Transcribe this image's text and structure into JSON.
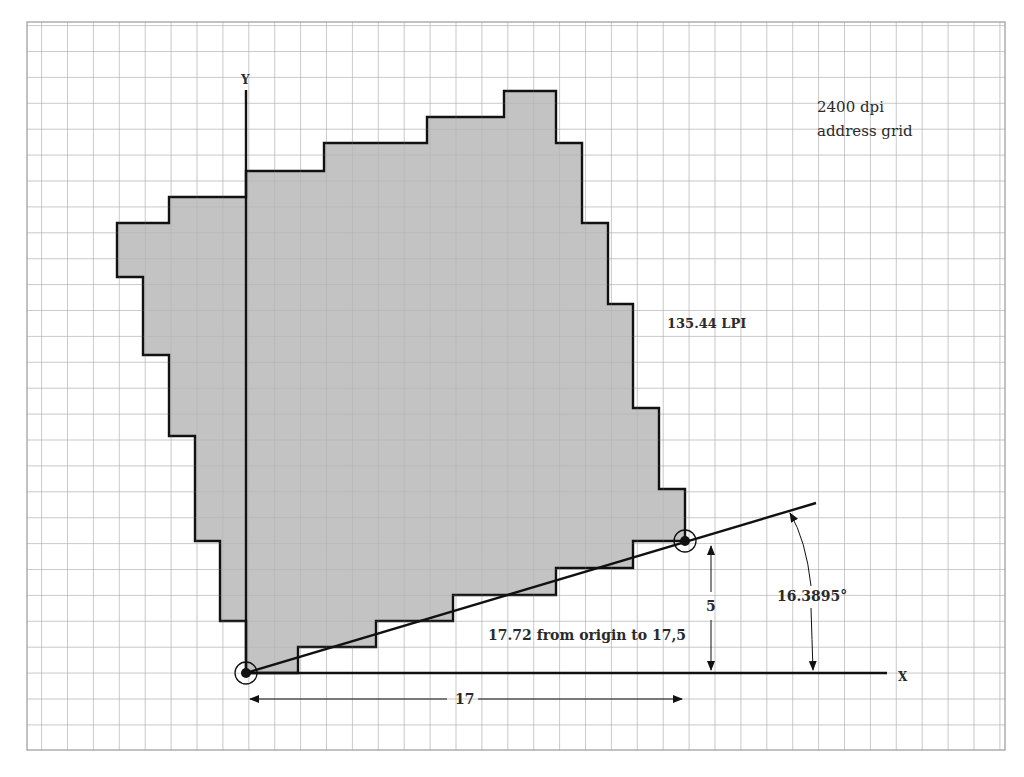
{
  "diagram": {
    "title_note_line1": "2400 dpi",
    "title_note_line2": "address grid",
    "lpi_label": "135.44 LPI",
    "distance_label": "17.72 from origin to 17,5",
    "angle_label": "16.3895°",
    "vertical_dim_label": "5",
    "horizontal_dim_label": "17",
    "x_axis_label": "X",
    "y_axis_label": "Y",
    "grid_units": "1 cell = 1 address unit",
    "origin_point": [
      0,
      0
    ],
    "target_point": [
      17,
      5
    ],
    "colors": {
      "grid": "#a8a8a8",
      "fill": "#b9b9b9",
      "stroke": "#111111",
      "text": "#2a2a2a"
    }
  }
}
